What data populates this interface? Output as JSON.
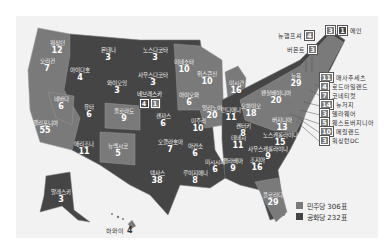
{
  "legend": {
    "democrat": {
      "label": "민주당 306표",
      "color": "#7a7a7a"
    },
    "republican": {
      "label": "공화당 232표",
      "color": "#454545"
    }
  },
  "states": [
    {
      "id": "wa",
      "name": "워싱턴",
      "ev": "12",
      "party": "dem",
      "x": 57,
      "y": 48
    },
    {
      "id": "or",
      "name": "오리건",
      "ev": "7",
      "party": "dem",
      "x": 47,
      "y": 66
    },
    {
      "id": "id",
      "name": "아이다호",
      "ev": "4",
      "party": "rep",
      "x": 80,
      "y": 75
    },
    {
      "id": "mt",
      "name": "몬태나",
      "ev": "3",
      "party": "rep",
      "x": 108,
      "y": 55
    },
    {
      "id": "wy",
      "name": "와이오밍",
      "ev": "3",
      "party": "rep",
      "x": 117,
      "y": 88
    },
    {
      "id": "nv",
      "name": "네바다",
      "ev": "6",
      "party": "dem",
      "x": 61,
      "y": 104
    },
    {
      "id": "ut",
      "name": "유타",
      "ev": "6",
      "party": "rep",
      "x": 89,
      "y": 112
    },
    {
      "id": "co",
      "name": "콜로라도",
      "ev": "9",
      "party": "dem",
      "x": 124,
      "y": 116
    },
    {
      "id": "ca",
      "name": "캘리포니아",
      "ev": "55",
      "party": "dem",
      "x": 45,
      "y": 128
    },
    {
      "id": "az",
      "name": "애리조나",
      "ev": "11",
      "party": "rep",
      "x": 84,
      "y": 149
    },
    {
      "id": "nm",
      "name": "뉴멕시코",
      "ev": "5",
      "party": "dem",
      "x": 118,
      "y": 151
    },
    {
      "id": "ak",
      "name": "알래스카",
      "ev": "3",
      "party": "rep",
      "x": 61,
      "y": 197
    },
    {
      "id": "nd",
      "name": "노스다코타",
      "ev": "3",
      "party": "rep",
      "x": 155,
      "y": 55
    },
    {
      "id": "sd",
      "name": "사우스다코타",
      "ev": "3",
      "party": "rep",
      "x": 153,
      "y": 80
    },
    {
      "id": "ks",
      "name": "캔자스",
      "ev": "6",
      "party": "rep",
      "x": 163,
      "y": 121
    },
    {
      "id": "ok",
      "name": "오클라호마",
      "ev": "7",
      "party": "rep",
      "x": 170,
      "y": 147
    },
    {
      "id": "tx",
      "name": "텍사스",
      "ev": "38",
      "party": "rep",
      "x": 157,
      "y": 178
    },
    {
      "id": "mn",
      "name": "미네소타",
      "ev": "10",
      "party": "dem",
      "x": 184,
      "y": 67
    },
    {
      "id": "ia",
      "name": "아이오와",
      "ev": "6",
      "party": "dem",
      "x": 189,
      "y": 100
    },
    {
      "id": "mo",
      "name": "미주리",
      "ev": "10",
      "party": "rep",
      "x": 198,
      "y": 126
    },
    {
      "id": "ar",
      "name": "아칸소",
      "ev": "6",
      "party": "rep",
      "x": 195,
      "y": 151
    },
    {
      "id": "la",
      "name": "루이지애나",
      "ev": "8",
      "party": "rep",
      "x": 195,
      "y": 178
    },
    {
      "id": "wi",
      "name": "위스콘신",
      "ev": "10",
      "party": "dem",
      "x": 207,
      "y": 79
    },
    {
      "id": "il",
      "name": "일리노이",
      "ev": "20",
      "party": "dem",
      "x": 212,
      "y": 113
    },
    {
      "id": "mi",
      "name": "미시간",
      "ev": "16",
      "party": "dem",
      "x": 236,
      "y": 88
    },
    {
      "id": "in",
      "name": "인디애나",
      "ev": "11",
      "party": "rep",
      "x": 231,
      "y": 115
    },
    {
      "id": "oh",
      "name": "오하이오",
      "ev": "18",
      "party": "dem",
      "x": 251,
      "y": 111
    },
    {
      "id": "pa",
      "name": "펜실베이니아",
      "ev": "20",
      "party": "dem",
      "x": 276,
      "y": 98
    },
    {
      "id": "ny",
      "name": "뉴욕",
      "ev": "29",
      "party": "dem",
      "x": 296,
      "y": 81
    },
    {
      "id": "ky",
      "name": "켄터키",
      "ev": "8",
      "party": "rep",
      "x": 243,
      "y": 131
    },
    {
      "id": "tn",
      "name": "테네시",
      "ev": "11",
      "party": "rep",
      "x": 238,
      "y": 143
    },
    {
      "id": "ms",
      "name": "미시시피",
      "ev": "6",
      "party": "rep",
      "x": 215,
      "y": 167
    },
    {
      "id": "al",
      "name": "앨라배마",
      "ev": "9",
      "party": "rep",
      "x": 233,
      "y": 166
    },
    {
      "id": "ga",
      "name": "조지아",
      "ev": "16",
      "party": "rep",
      "x": 257,
      "y": 165
    },
    {
      "id": "sc",
      "name": "사우스캐롤라이나",
      "ev": "9",
      "party": "rep",
      "x": 268,
      "y": 154
    },
    {
      "id": "nc",
      "name": "노스캐롤라이나",
      "ev": "15",
      "party": "rep",
      "x": 280,
      "y": 140
    },
    {
      "id": "va",
      "name": "버지니아",
      "ev": "13",
      "party": "dem",
      "x": 282,
      "y": 125
    },
    {
      "id": "fl",
      "name": "플로리다",
      "ev": "29",
      "party": "dem",
      "x": 273,
      "y": 200
    }
  ],
  "split_states": [
    {
      "id": "ne",
      "name": "네브래스카",
      "ev_parts": [
        "4",
        "1"
      ],
      "x": 150,
      "y": 102
    }
  ],
  "hawaii": {
    "name": "하와이",
    "ev": "4"
  },
  "callouts_top": [
    {
      "id": "nh",
      "name": "뉴햄프셔",
      "ev": "4"
    },
    {
      "id": "vt",
      "name": "버몬트",
      "ev": "3"
    },
    {
      "id": "me",
      "name": "메인",
      "ev_parts": [
        "3",
        "1"
      ]
    }
  ],
  "callouts_right": [
    {
      "id": "ma",
      "name": "매사추세츠",
      "ev": "11"
    },
    {
      "id": "ri",
      "name": "로드아일랜드",
      "ev": "4"
    },
    {
      "id": "ct",
      "name": "코네티컷",
      "ev": "7"
    },
    {
      "id": "nj",
      "name": "뉴저지",
      "ev": "14"
    },
    {
      "id": "de",
      "name": "델라웨어",
      "ev": "3"
    },
    {
      "id": "wv",
      "name": "웨스트버지니아",
      "ev": "5"
    },
    {
      "id": "md",
      "name": "메릴랜드",
      "ev": "10"
    },
    {
      "id": "dc",
      "name": "워싱턴DC",
      "ev": "3"
    }
  ]
}
